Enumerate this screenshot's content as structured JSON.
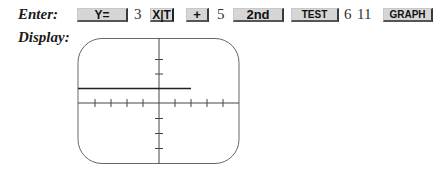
{
  "labels": {
    "enter": "Enter:",
    "display": "Display:"
  },
  "keystrokes": [
    {
      "type": "key",
      "label": "Y="
    },
    {
      "type": "number",
      "label": "3"
    },
    {
      "type": "key",
      "label": "X|T"
    },
    {
      "type": "key",
      "label": "+"
    },
    {
      "type": "number",
      "label": "5"
    },
    {
      "type": "key",
      "label": "2nd"
    },
    {
      "type": "key",
      "label": "TEST"
    },
    {
      "type": "number",
      "label": "6"
    },
    {
      "type": "number",
      "label": "11"
    },
    {
      "type": "key",
      "label": "GRAPH"
    }
  ],
  "keys": {
    "y_equals": "Y=",
    "num_3": "3",
    "x_t": "X|T",
    "plus": "+",
    "num_5": "5",
    "second": "2nd",
    "test": "TEST",
    "num_6": "6",
    "num_11": "11",
    "graph": "GRAPH"
  },
  "display": {
    "x_ticks": [
      -4,
      -3,
      -2,
      -1,
      1,
      2,
      3,
      4
    ],
    "y_ticks": [
      -3,
      -2,
      -1,
      1,
      2,
      3
    ],
    "graph_segment": {
      "y": 1,
      "x_start": -5,
      "x_end": 2
    },
    "colors": {
      "key_face": "#d6d6d6",
      "key_shadow": "#3a3a3a",
      "axis": "#444444",
      "curve": "#222222",
      "frame": "#555555"
    }
  }
}
